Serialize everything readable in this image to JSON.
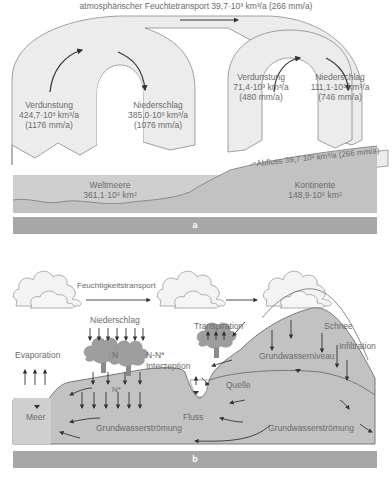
{
  "panel_a": {
    "label": "a",
    "top_transport": "atmosphärischer Feuchtetransport 39,7·10³ km³/a (266 mm/a)",
    "ocean_cycle": {
      "evaporation": {
        "title": "Verdunstung",
        "volume": "424,7·10³ km³/a",
        "depth": "(1176 mm/a)"
      },
      "precipitation": {
        "title": "Niederschlag",
        "volume": "385,0·10³ km³/a",
        "depth": "(1076 mm/a)"
      }
    },
    "land_cycle": {
      "evaporation": {
        "title": "Verdunstung",
        "volume": "71,4·10³ km³/a",
        "depth": "(480 mm/a)"
      },
      "precipitation": {
        "title": "Niederschlag",
        "volume": "111,1·10³ km³/a",
        "depth": "(746 mm/a)"
      }
    },
    "runoff": "Abfluss 39,7·10³ km³/a (266 mm/a)",
    "ocean": {
      "name": "Weltmeere",
      "area": "361,1·10⁶ km²"
    },
    "continents": {
      "name": "Kontinente",
      "area": "148,9·10⁶ km²"
    }
  },
  "panel_b": {
    "label": "b",
    "moisture_transport": "Feuchtigkeitstransport",
    "labels": {
      "precipitation": "Niederschlag",
      "n": "N",
      "n_minus_nstar": "N-N*",
      "interception": "Interzeption",
      "nstar": "N*",
      "evaporation": "Evaporation",
      "transpiration": "Transpiration",
      "snow": "Schnee",
      "infiltration": "Infiltration",
      "water_table": "Grundwasserniveau",
      "spring": "Quelle",
      "sea": "Meer",
      "river": "Fluss",
      "groundwater_flow_1": "Grundwasserströmung",
      "groundwater_flow_2": "Grundwasserströmung"
    }
  },
  "colors": {
    "cycle_fill": "#ececec",
    "cycle_stroke": "#8a8a8a",
    "ground": "#c2c2c2",
    "ocean": "#cfcfcf",
    "label_bar": "#a7a7a7",
    "text": "#6b6b6b",
    "arrow": "#333333"
  }
}
